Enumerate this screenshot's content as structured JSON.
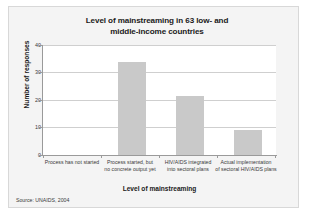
{
  "figure": {
    "background_color": "#f4f4f4",
    "plot_background_color": "#ffffff",
    "border_color": "#d8d8d8"
  },
  "source_note": "Source: UNAIDS, 2004",
  "chart_data": {
    "type": "bar",
    "title": "Level of mainstreaming in 63 low- and middle-income countries",
    "title_lines": [
      "Level of mainstreaming in 63 low- and",
      "middle-income countries"
    ],
    "xlabel": "Level of mainstreaming",
    "ylabel": "Number of responses",
    "categories": [
      "Process has not started",
      "Process started, but no concrete output yet",
      "HIV/AIDS integrated into sectoral plans",
      "Actual implementation of sectoral HIV/AIDS plans"
    ],
    "category_lines": [
      [
        "Process has not started",
        ""
      ],
      [
        "Process started, but",
        "no concrete output yet"
      ],
      [
        "HIV/AIDS integrated",
        "into sectoral plans"
      ],
      [
        "Actual implementation",
        "of sectoral HIV/AIDS plans"
      ]
    ],
    "values": [
      0,
      34,
      21.5,
      9
    ],
    "ylim": [
      0,
      40
    ],
    "yticks": [
      0,
      10,
      20,
      30,
      40
    ],
    "ytick_labels": [
      "0",
      "10",
      "20",
      "30",
      "40"
    ],
    "grid": true,
    "grid_axis": "y",
    "legend": false,
    "bar_color": "#c9c9c9",
    "grid_color": "#cfcfcf",
    "axis_color": "#9a9a9a"
  }
}
